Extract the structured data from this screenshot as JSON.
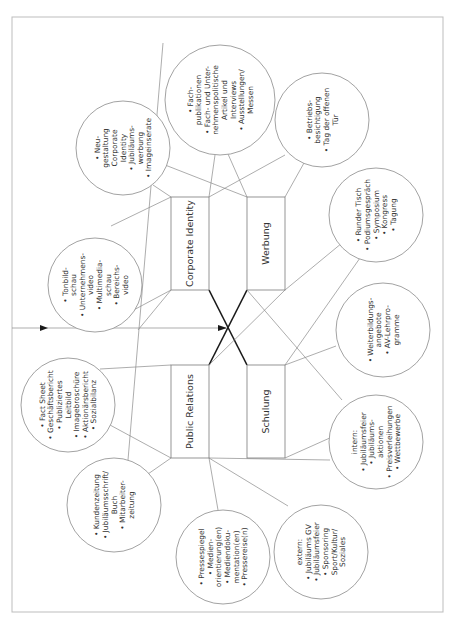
{
  "diagram": {
    "orientation": "rotated-90-ccw",
    "colors": {
      "line": "#8a8a8a",
      "bold_line": "#1a1a1a",
      "text": "#333333",
      "frame": "#bdbdbd"
    },
    "boxes": {
      "corporate_identity": "Corporate Identity",
      "werbung": "Werbung",
      "public_relations": "Public Relations",
      "schulung": "Schulung"
    },
    "circles": {
      "tonbild": [
        "• Tonbild-",
        "schau",
        "• Unternehmens-",
        "video",
        "• Multimedia-",
        "schau",
        "• Bereichs-",
        "video"
      ],
      "neugestaltung": [
        "• Neu-",
        "gestaltung",
        "Corporate",
        "Identity",
        "• Jubiläums-",
        "werbung",
        "• Imageinserate"
      ],
      "fachpublikationen": [
        "• Fach-",
        "publikationen",
        "• Fach- und Unter-",
        "nehmenspolitische",
        "Artikel und",
        "Interviews",
        "• Ausstellungen/",
        "Messen"
      ],
      "betrieb": [
        "• Betriebs-",
        "besichtigung",
        "• Tag der offenen",
        "Tür"
      ],
      "runder_tisch": [
        "• Runder Tisch",
        "• Podiumsgespräch",
        "• Symposium",
        "• Kongress",
        "• Tagung"
      ],
      "weiterbildung": [
        "• Weiterbildungs-",
        "angebote",
        "• AV-Lehrpro-",
        "gramme"
      ],
      "intern": [
        "intern:",
        "• Jubiläumsfeier",
        "• Jubiläums-",
        "aktionen",
        "• Preisverleihungen",
        "• Wettbewerbe"
      ],
      "extern": [
        "extern:",
        "• Jubiläums GV",
        "• Jubiläumsfeier",
        "• Sponsoring",
        "Sport/Kultur/",
        "Soziales"
      ],
      "presse": [
        "• Pressespiegel",
        "• Medien-",
        "orientierung(en)",
        "• Mediendoku-",
        "mentation(en)",
        "• Pressereise(n)"
      ],
      "kunden": [
        "• Kundenzeitung",
        "• Jubiläumsschrift/",
        "Buch",
        "• Mitarbeiter-",
        "zeitung"
      ],
      "factsheet": [
        "• Fact Sheet",
        "• Geschäftsbericht",
        "• Publiziertes",
        "Leitbild",
        "• Imagebroschüre",
        "• Aktionärsbericht",
        "• Sozialbilanz"
      ]
    }
  }
}
